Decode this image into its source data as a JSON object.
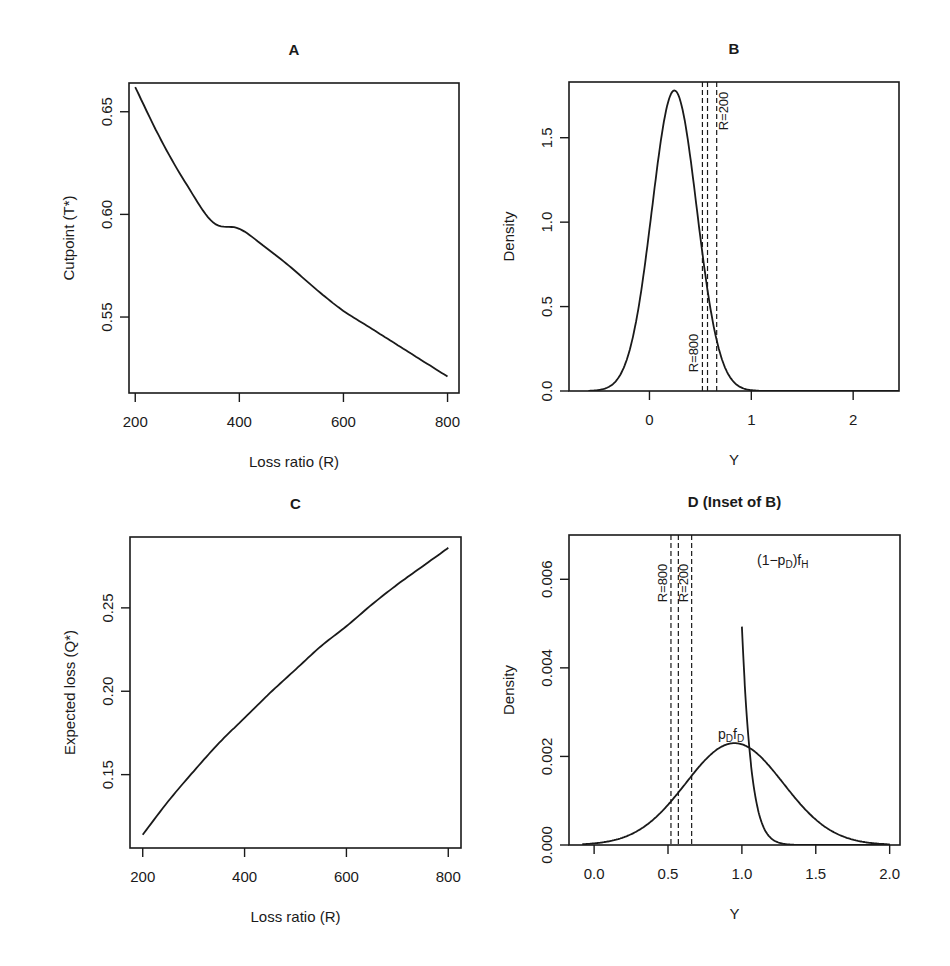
{
  "caption_fragment": "",
  "chart_data": [
    {
      "id": "A",
      "type": "line",
      "title": "A",
      "xlabel": "Loss ratio (R)",
      "ylabel": "Cutpoint (T*)",
      "xlim": [
        188,
        822
      ],
      "ylim": [
        0.513,
        0.664
      ],
      "xticks": [
        200,
        400,
        600,
        800
      ],
      "xtick_labels": [
        "200",
        "400",
        "600",
        "800"
      ],
      "yticks": [
        0.55,
        0.6,
        0.65
      ],
      "ytick_labels": [
        "0.55",
        "0.60",
        "0.65"
      ],
      "grid": false,
      "series": [
        {
          "name": "Cutpoint",
          "x": [
            200,
            250,
            300,
            350,
            400,
            450,
            500,
            550,
            600,
            650,
            700,
            750,
            800
          ],
          "y": [
            0.662,
            0.636,
            0.614,
            0.596,
            0.593,
            0.584,
            0.574,
            0.563,
            0.553,
            0.545,
            0.537,
            0.529,
            0.521
          ]
        }
      ]
    },
    {
      "id": "B",
      "type": "line",
      "title": "B",
      "xlabel": "Y",
      "ylabel": "Density",
      "xlim": [
        -0.79,
        2.45
      ],
      "ylim": [
        0,
        1.83
      ],
      "xticks": [
        0,
        1,
        2
      ],
      "xtick_labels": [
        "0",
        "1",
        "2"
      ],
      "yticks": [
        0.0,
        0.5,
        1.0,
        1.5
      ],
      "ytick_labels": [
        "0.0",
        "0.5",
        "1.0",
        "1.5"
      ],
      "grid": false,
      "series": [
        {
          "name": "Density",
          "gaussian": {
            "mean": 0.245,
            "sd": 0.22,
            "peak": 1.78
          },
          "x_range": [
            -0.6,
            2.45
          ]
        }
      ],
      "vlines": [
        {
          "x": 0.52,
          "label": "R=800",
          "label_pos": "bottom"
        },
        {
          "x": 0.57,
          "label": "",
          "label_pos": ""
        },
        {
          "x": 0.66,
          "label": "R=200",
          "label_pos": "top"
        }
      ]
    },
    {
      "id": "C",
      "type": "line",
      "title": "C",
      "xlabel": "Loss ratio (R)",
      "ylabel": "Expected loss (Q*)",
      "xlim": [
        175,
        825
      ],
      "ylim": [
        0.106,
        0.2925
      ],
      "xticks": [
        200,
        400,
        600,
        800
      ],
      "xtick_labels": [
        "200",
        "400",
        "600",
        "800"
      ],
      "yticks": [
        0.15,
        0.2,
        0.25
      ],
      "ytick_labels": [
        "0.15",
        "0.20",
        "0.25"
      ],
      "grid": false,
      "series": [
        {
          "name": "Expected loss",
          "x": [
            200,
            250,
            300,
            350,
            400,
            450,
            500,
            550,
            600,
            650,
            700,
            750,
            800
          ],
          "y": [
            0.114,
            0.134,
            0.152,
            0.169,
            0.184,
            0.199,
            0.213,
            0.227,
            0.239,
            0.252,
            0.264,
            0.275,
            0.286
          ]
        }
      ]
    },
    {
      "id": "D",
      "type": "line",
      "title": "D (Inset of B)",
      "xlabel": "Y",
      "ylabel": "Density",
      "xlim": [
        -0.17,
        2.07
      ],
      "ylim": [
        0,
        0.007
      ],
      "xticks": [
        0.0,
        0.5,
        1.0,
        1.5,
        2.0
      ],
      "xtick_labels": [
        "0.0",
        "0.5",
        "1.0",
        "1.5",
        "2.0"
      ],
      "yticks": [
        0.0,
        0.002,
        0.004,
        0.006
      ],
      "ytick_labels": [
        "0.000",
        "0.002",
        "0.004",
        "0.006"
      ],
      "grid": false,
      "series": [
        {
          "name": "(1−p_D)f_H",
          "gaussian": {
            "mean": 0.245,
            "sd": 0.22,
            "peak": 1.78
          },
          "x_range": [
            1.0,
            2.0
          ],
          "label": "(1−p",
          "label_sub1": "D",
          "label_mid": ")f",
          "label_sub2": "H"
        },
        {
          "name": "p_D f_D",
          "gaussian": {
            "mean": 0.95,
            "sd": 0.33,
            "peak": 0.0023
          },
          "x_range": [
            -0.08,
            2.0
          ],
          "label": "p",
          "label_sub1": "D",
          "label_mid": "f",
          "label_sub2": "D"
        }
      ],
      "vlines": [
        {
          "x": 0.52,
          "label": "R=800",
          "label_pos": "top"
        },
        {
          "x": 0.57,
          "label": "",
          "label_pos": ""
        },
        {
          "x": 0.66,
          "label": "R=200",
          "label_pos": "top"
        }
      ]
    }
  ],
  "panels_layout": {
    "A": {
      "left": 129,
      "right": 459,
      "top": 83,
      "bottom": 393
    },
    "B": {
      "left": 569,
      "right": 899,
      "top": 82,
      "bottom": 391
    },
    "C": {
      "left": 130,
      "right": 461,
      "top": 537,
      "bottom": 848
    },
    "D": {
      "left": 569,
      "right": 900,
      "top": 535,
      "bottom": 845
    }
  }
}
